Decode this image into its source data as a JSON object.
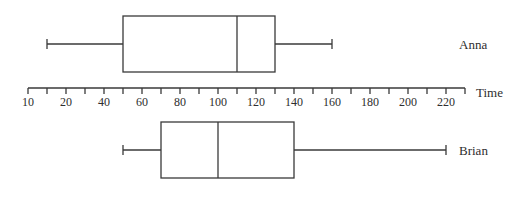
{
  "chart_data": {
    "type": "boxplot",
    "title": "",
    "xlabel": "Time",
    "ylabel": "",
    "xlim": [
      0,
      230
    ],
    "tick_values": [
      0,
      10,
      20,
      30,
      40,
      50,
      60,
      70,
      80,
      90,
      100,
      110,
      120,
      130,
      140,
      150,
      160,
      170,
      180,
      190,
      200,
      210,
      220,
      230
    ],
    "tick_labels": [
      {
        "value": 0,
        "label": "10"
      },
      {
        "value": 20,
        "label": "20"
      },
      {
        "value": 40,
        "label": "40"
      },
      {
        "value": 60,
        "label": "60"
      },
      {
        "value": 80,
        "label": "80"
      },
      {
        "value": 100,
        "label": "100"
      },
      {
        "value": 120,
        "label": "120"
      },
      {
        "value": 140,
        "label": "140"
      },
      {
        "value": 160,
        "label": "160"
      },
      {
        "value": 180,
        "label": "180"
      },
      {
        "value": 200,
        "label": "200"
      },
      {
        "value": 220,
        "label": "220"
      }
    ],
    "grid": false,
    "series": [
      {
        "name": "Anna",
        "min": 10,
        "q1": 50,
        "median": 110,
        "q3": 130,
        "max": 160,
        "position": "above-axis"
      },
      {
        "name": "Brian",
        "min": 50,
        "q1": 70,
        "median": 100,
        "q3": 140,
        "max": 220,
        "position": "below-axis"
      }
    ]
  },
  "layout": {
    "x0": 28,
    "px_per_unit": 1.9,
    "axis_y": 88,
    "tick_len": 6,
    "label_y": 106,
    "label_x": 459,
    "axis_title_x": 476,
    "axis_title_y": 97,
    "boxes": [
      {
        "top": 16,
        "bottom": 72,
        "mid": 44,
        "label_y": 49
      },
      {
        "top": 122,
        "bottom": 178,
        "mid": 150,
        "label_y": 155
      }
    ]
  }
}
